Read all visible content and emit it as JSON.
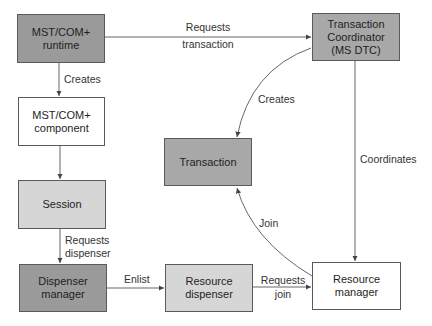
{
  "nodes": {
    "runtime": {
      "line1": "MST/COM+",
      "line2": "runtime"
    },
    "component": {
      "line1": "MST/COM+",
      "line2": "component"
    },
    "session": {
      "label": "Session"
    },
    "dispenser_manager": {
      "line1": "Dispenser",
      "line2": "manager"
    },
    "coordinator": {
      "line1": "Transaction",
      "line2": "Coordinator",
      "line3": "(MS DTC)"
    },
    "transaction": {
      "label": "Transaction"
    },
    "resource_dispenser": {
      "line1": "Resource",
      "line2": "dispenser"
    },
    "resource_manager": {
      "line1": "Resource",
      "line2": "manager"
    }
  },
  "edges": {
    "runtime_to_coordinator": {
      "line1": "Requests",
      "line2": "transaction"
    },
    "runtime_to_component": {
      "label": "Creates"
    },
    "coordinator_to_transaction": {
      "label": "Creates"
    },
    "coordinator_to_resource_manager": {
      "label": "Coordinates"
    },
    "session_to_dispenser_manager": {
      "line1": "Requests",
      "line2": "dispenser"
    },
    "dispenser_manager_to_resource_dispenser": {
      "label": "Enlist"
    },
    "resource_dispenser_to_resource_manager": {
      "line1": "Requests",
      "line2": "join"
    },
    "resource_manager_to_transaction": {
      "label": "Join"
    }
  }
}
